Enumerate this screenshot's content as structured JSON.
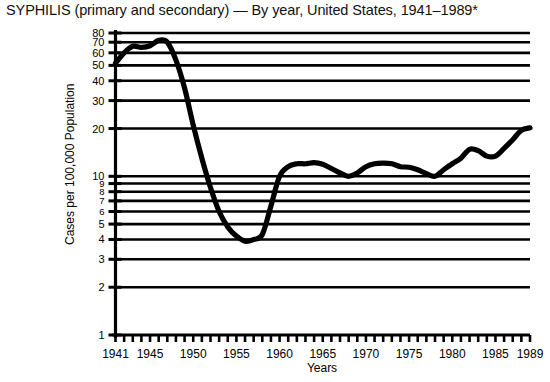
{
  "chart_data": {
    "type": "line",
    "title": "SYPHILIS (primary and secondary) — By year, United States, 1941–1989*",
    "xlabel": "Years",
    "ylabel": "Cases per 100,000 Population",
    "yscale": "log",
    "ylim": [
      1,
      80
    ],
    "xlim": [
      1941,
      1989
    ],
    "grid": true,
    "legend": "none",
    "y_ticks": [
      1,
      2,
      3,
      4,
      5,
      6,
      7,
      8,
      9,
      10,
      20,
      30,
      40,
      50,
      60,
      70,
      80
    ],
    "y_tick_labels": [
      "1",
      "2",
      "3",
      "4",
      "5",
      "6",
      "7",
      "8",
      "9",
      "10",
      "20",
      "30",
      "40",
      "50",
      "60",
      "70",
      "80"
    ],
    "x_ticks": [
      1941,
      1945,
      1950,
      1955,
      1960,
      1965,
      1970,
      1975,
      1980,
      1985,
      1989
    ],
    "x_tick_labels": [
      "1941",
      "1945",
      "1950",
      "1955",
      "1960",
      "1965",
      "1970",
      "1975",
      "1980",
      "1985",
      "1989"
    ],
    "x_minor_tick_step": 1,
    "series": [
      {
        "name": "Primary and secondary syphilis rate",
        "x": [
          1941,
          1942,
          1943,
          1944,
          1945,
          1946,
          1947,
          1948,
          1949,
          1950,
          1951,
          1952,
          1953,
          1954,
          1955,
          1956,
          1957,
          1958,
          1959,
          1960,
          1961,
          1962,
          1963,
          1964,
          1965,
          1966,
          1967,
          1968,
          1969,
          1970,
          1971,
          1972,
          1973,
          1974,
          1975,
          1976,
          1977,
          1978,
          1979,
          1980,
          1981,
          1982,
          1983,
          1984,
          1985,
          1986,
          1987,
          1988,
          1989
        ],
        "values": [
          51.7,
          60.0,
          66.0,
          65.0,
          66.5,
          71.9,
          70.0,
          54.0,
          36.0,
          21.0,
          13.0,
          8.5,
          6.0,
          4.8,
          4.2,
          3.9,
          4.0,
          4.3,
          6.5,
          10.0,
          11.5,
          12.0,
          12.0,
          12.2,
          11.9,
          11.2,
          10.5,
          10.0,
          10.5,
          11.5,
          12.0,
          12.1,
          12.0,
          11.5,
          11.4,
          11.0,
          10.4,
          10.0,
          11.0,
          12.0,
          13.0,
          14.8,
          14.5,
          13.4,
          13.4,
          15.0,
          17.0,
          19.5,
          20.2
        ]
      }
    ]
  }
}
